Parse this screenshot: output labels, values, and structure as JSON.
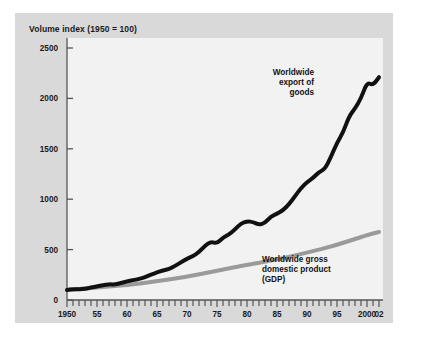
{
  "figure": {
    "title": "Volume index (1950 = 100)",
    "panel_bg": "#d9d9d9",
    "plot_bg": "#f2f2f2",
    "page_bg": "#ffffff"
  },
  "annotations": {
    "exports": {
      "line1": "Worldwide",
      "line2": "export of",
      "line3": "goods"
    },
    "gdp": {
      "line1": "Worldwide gross",
      "line2": "domestic product",
      "line3": "(GDP)"
    }
  },
  "axis": {
    "y_ticks": [
      "0",
      "500",
      "1000",
      "1500",
      "2000",
      "2500"
    ],
    "x_ticks": [
      "1950",
      "55",
      "60",
      "65",
      "70",
      "75",
      "80",
      "85",
      "90",
      "95",
      "2000",
      "02"
    ]
  },
  "chart_data": {
    "type": "line",
    "title": "Volume index (1950 = 100)",
    "xlabel": "",
    "ylabel": "Volume index (1950 = 100)",
    "xlim": [
      1950,
      2002
    ],
    "ylim": [
      0,
      2500
    ],
    "y_ticks": [
      0,
      500,
      1000,
      1500,
      2000,
      2500
    ],
    "x_ticks": [
      1950,
      1955,
      1960,
      1965,
      1970,
      1975,
      1980,
      1985,
      1990,
      1995,
      2000,
      2002
    ],
    "x_tick_labels": [
      "1950",
      "55",
      "60",
      "65",
      "70",
      "75",
      "80",
      "85",
      "90",
      "95",
      "2000",
      "02"
    ],
    "x_minor_tick_interval": 1,
    "grid": false,
    "legend": "inline-annotations",
    "series": [
      {
        "name": "Worldwide export of goods",
        "color": "#111111",
        "line_width": 4,
        "x": [
          1950,
          1951,
          1952,
          1953,
          1954,
          1955,
          1956,
          1957,
          1958,
          1959,
          1960,
          1961,
          1962,
          1963,
          1964,
          1965,
          1966,
          1967,
          1968,
          1969,
          1970,
          1971,
          1972,
          1973,
          1974,
          1975,
          1976,
          1977,
          1978,
          1979,
          1980,
          1981,
          1982,
          1983,
          1984,
          1985,
          1986,
          1987,
          1988,
          1989,
          1990,
          1991,
          1992,
          1993,
          1994,
          1995,
          1996,
          1997,
          1998,
          1999,
          2000,
          2001,
          2002
        ],
        "values": [
          100,
          108,
          106,
          112,
          122,
          135,
          148,
          156,
          154,
          168,
          185,
          196,
          208,
          226,
          252,
          272,
          294,
          306,
          338,
          374,
          410,
          436,
          476,
          540,
          580,
          560,
          620,
          650,
          700,
          760,
          780,
          775,
          745,
          765,
          830,
          855,
          890,
          950,
          1030,
          1110,
          1170,
          1210,
          1270,
          1300,
          1420,
          1560,
          1660,
          1820,
          1900,
          2000,
          2160,
          2130,
          2210
        ]
      },
      {
        "name": "Worldwide gross domestic product (GDP)",
        "color": "#9a9a9a",
        "line_width": 4,
        "x": [
          1950,
          1955,
          1960,
          1965,
          1970,
          1975,
          1980,
          1985,
          1990,
          1995,
          2000,
          2002
        ],
        "values": [
          100,
          124,
          148,
          186,
          230,
          290,
          350,
          400,
          470,
          545,
          645,
          675
        ]
      }
    ]
  }
}
